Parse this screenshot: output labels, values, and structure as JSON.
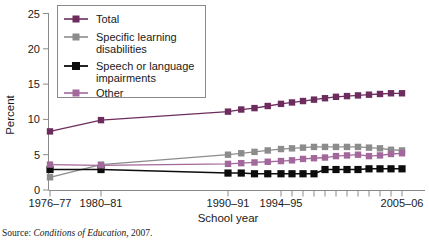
{
  "chart_data": {
    "type": "line",
    "title": "",
    "xlabel": "School year",
    "ylabel": "Percent",
    "ylim": [
      0,
      25
    ],
    "yticks": [
      0,
      5,
      10,
      15,
      20,
      25
    ],
    "grid": false,
    "legend_position": "upper-left-inside",
    "x_tick_labels": [
      "1976–77",
      "1980–81",
      "1990–91",
      "1994–95",
      "2005–06"
    ],
    "x_tick_values": [
      1976,
      1980,
      1990,
      1994,
      2005
    ],
    "x_minor_ticks": [
      1995,
      1996,
      1997,
      1998,
      1999,
      2000,
      2001,
      2002,
      2003,
      2004
    ],
    "x": [
      1976,
      1980,
      1990,
      1991,
      1992,
      1993,
      1994,
      1995,
      1996,
      1997,
      1998,
      1999,
      2000,
      2001,
      2002,
      2003,
      2004,
      2005
    ],
    "series": [
      {
        "name": "Total",
        "color": "#6d2c5e",
        "values": [
          8.3,
          9.9,
          11.1,
          11.4,
          11.6,
          11.9,
          12.2,
          12.4,
          12.6,
          12.8,
          13.0,
          13.2,
          13.3,
          13.4,
          13.5,
          13.6,
          13.7,
          13.7
        ]
      },
      {
        "name": "Specific learning disabilities",
        "color": "#8c8c8c",
        "values": [
          1.8,
          3.6,
          5.0,
          5.2,
          5.4,
          5.6,
          5.8,
          5.9,
          6.0,
          6.1,
          6.1,
          6.1,
          6.1,
          6.1,
          6.0,
          5.9,
          5.7,
          5.6
        ]
      },
      {
        "name": "Speech or language impairments",
        "color": "#0d0d0d",
        "values": [
          2.9,
          2.9,
          2.4,
          2.4,
          2.3,
          2.3,
          2.3,
          2.3,
          2.3,
          2.3,
          2.9,
          2.9,
          2.9,
          2.9,
          3.0,
          3.0,
          3.0,
          3.0
        ]
      },
      {
        "name": "Other",
        "color": "#a3689b",
        "values": [
          3.6,
          3.5,
          3.7,
          3.8,
          3.9,
          4.0,
          4.1,
          4.2,
          4.4,
          4.5,
          4.6,
          4.8,
          4.9,
          5.0,
          4.8,
          4.9,
          5.1,
          5.2
        ]
      }
    ]
  },
  "legend": {
    "entries": [
      {
        "label": "Total",
        "color": "#6d2c5e"
      },
      {
        "label": "Specific learning",
        "label2": "disabilities",
        "color": "#8c8c8c"
      },
      {
        "label": "Speech or language",
        "label2": "impairments",
        "color": "#0d0d0d"
      },
      {
        "label": "Other",
        "color": "#a3689b"
      }
    ]
  },
  "axes": {
    "y_label": "Percent",
    "x_label": "School year",
    "y_tick_0": "0",
    "y_tick_5": "5",
    "y_tick_10": "10",
    "y_tick_15": "15",
    "y_tick_20": "20",
    "y_tick_25": "25",
    "x_tick_0": "1976–77",
    "x_tick_1": "1980–81",
    "x_tick_2": "1990–91",
    "x_tick_3": "1994–95",
    "x_tick_4": "2005–06"
  },
  "source": {
    "label": "Source:",
    "title": "Conditions of Education,",
    "year": "2007."
  }
}
